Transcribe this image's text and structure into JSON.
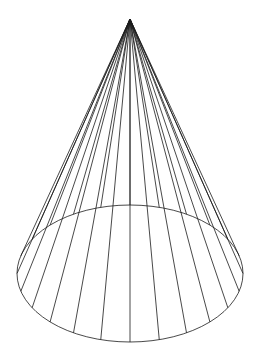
{
  "figure": {
    "type": "wireframe-cone",
    "width": 259,
    "height": 361,
    "background": "#ffffff",
    "stroke": "#1a1a1a",
    "stroke_width": 0.8,
    "apex": {
      "x": 130,
      "y": 19
    },
    "base": {
      "cx": 130,
      "cy": 273.5,
      "rx": 113,
      "ry": 68.5
    },
    "generator_count": 24
  }
}
